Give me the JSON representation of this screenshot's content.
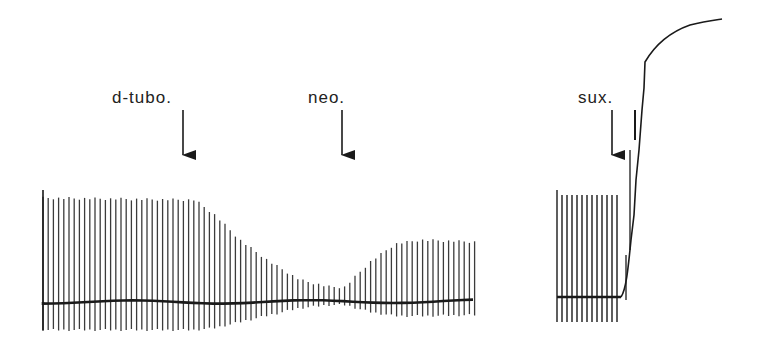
{
  "figure": {
    "type": "myograph-trace",
    "background": "#ffffff",
    "ink": "#1a1a1a",
    "annotations": [
      {
        "label": "d-tubo.",
        "x": 183,
        "text_x": 112,
        "text_y": 89
      },
      {
        "label": "neo.",
        "x": 342,
        "text_x": 308,
        "text_y": 89
      },
      {
        "label": "sux.",
        "x": 612,
        "text_x": 578,
        "text_y": 89
      }
    ],
    "left_trace": {
      "x_start": 43,
      "x_end": 477,
      "baseline_y": 302,
      "spike_spacing": 5.2,
      "amplitude_profile": [
        {
          "x": 43,
          "top": 198,
          "bottom": 330
        },
        {
          "x": 195,
          "top": 200,
          "bottom": 330
        },
        {
          "x": 215,
          "top": 215,
          "bottom": 328
        },
        {
          "x": 240,
          "top": 240,
          "bottom": 322
        },
        {
          "x": 270,
          "top": 262,
          "bottom": 315
        },
        {
          "x": 300,
          "top": 280,
          "bottom": 308
        },
        {
          "x": 330,
          "top": 287,
          "bottom": 305
        },
        {
          "x": 345,
          "top": 287,
          "bottom": 305
        },
        {
          "x": 370,
          "top": 262,
          "bottom": 312
        },
        {
          "x": 395,
          "top": 244,
          "bottom": 316
        },
        {
          "x": 420,
          "top": 240,
          "bottom": 316
        },
        {
          "x": 477,
          "top": 242,
          "bottom": 315
        }
      ]
    },
    "right_trace": {
      "x_start": 557,
      "x_end": 621,
      "baseline_y": 297,
      "spike_spacing": 5,
      "spike_top": 195,
      "spike_bottom": 322,
      "contracture_path": "M621,297 C626,290 628,270 631,240 L634,215 L636,180 L639,150 L642,110 L644,88 L645,62 C655,45 670,32 690,25 C705,21 715,20 722,19"
    }
  }
}
